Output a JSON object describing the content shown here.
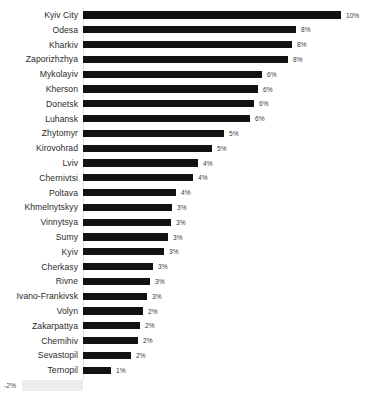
{
  "chart_data": {
    "type": "bar",
    "orientation": "horizontal",
    "title": "",
    "subtitle": "",
    "xlabel": "",
    "ylabel": "",
    "grid": false,
    "legend": null,
    "axis_zero_position_px": 83,
    "xlim": [
      -2,
      10
    ],
    "value_format": "percent",
    "categories": [
      "Kyiv City",
      "Odesa",
      "Kharkiv",
      "Zaporizhzhya",
      "Mykolayiv",
      "Kherson",
      "Donetsk",
      "Luhansk",
      "Zhytomyr",
      "Kirovohrad",
      "Lviv",
      "Chernivtsi",
      "Poltava",
      "Khmelnytskyy",
      "Vinnytsya",
      "Sumy",
      "Kyiv",
      "Cherkasy",
      "Rivne",
      "Ivano-Frankivsk",
      "Volyn",
      "Zakarpattya",
      "Chernihiv",
      "Sevastopil",
      "Ternopil",
      "Crimea"
    ],
    "values": [
      10,
      8,
      8,
      8,
      6,
      6,
      6,
      6,
      5,
      5,
      4,
      4,
      4,
      3,
      3,
      3,
      3,
      3,
      3,
      3,
      2,
      2,
      2,
      2,
      1,
      -2
    ],
    "data_labels": [
      "10%",
      "8%",
      "8%",
      "8%",
      "6%",
      "6%",
      "6%",
      "6%",
      "5%",
      "5%",
      "4%",
      "4%",
      "4%",
      "3%",
      "3%",
      "3%",
      "3%",
      "3%",
      "3%",
      "3%",
      "2%",
      "2%",
      "2%",
      "2%",
      "1%",
      "-2%"
    ],
    "bar_end_px": [
      341,
      296,
      292,
      288,
      262,
      258,
      254,
      250,
      224,
      212,
      198,
      193,
      176,
      172,
      171,
      168,
      164,
      153,
      150,
      147,
      143,
      140,
      138,
      131,
      111,
      22
    ],
    "colors": {
      "bar_positive": "#121212",
      "bar_negative": "#ececec",
      "category_label": "#2b2b2b",
      "value_label": "#3a3a3a",
      "axis_line": "#e3e3e3",
      "background": "#ffffff"
    }
  }
}
